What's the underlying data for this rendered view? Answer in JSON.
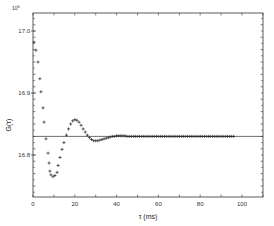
{
  "chart_data": {
    "type": "scatter",
    "title": "",
    "xlabel": "τ (ms)",
    "ylabel": "G(τ)",
    "y_multiplier": "10^6",
    "y_multiplier_label": "10",
    "y_multiplier_exp": "6",
    "xlim": [
      0,
      110
    ],
    "ylim": [
      16.73,
      17.03
    ],
    "x_ticks": [
      0,
      20,
      40,
      60,
      80,
      100
    ],
    "x_tick_labels": [
      "0",
      "20",
      "40",
      "60",
      "80",
      "100"
    ],
    "y_ticks": [
      16.8,
      16.9,
      17.0
    ],
    "y_tick_labels": [
      "16.8",
      "16.9",
      "17.0"
    ],
    "baseline": 16.83,
    "grid": false,
    "marker": "+",
    "series": [
      {
        "name": "G(τ)",
        "x": [
          0.5,
          1.4,
          2.4,
          3.3,
          3.8,
          4.8,
          5.3,
          6.2,
          7.2,
          7.7,
          8.1,
          8.6,
          9.6,
          10.5,
          11.5,
          12.0,
          12.9,
          13.9,
          14.8,
          16,
          17,
          18,
          19,
          20,
          21,
          22,
          23,
          24,
          25,
          26,
          27,
          28,
          29,
          30,
          31,
          32,
          33,
          34,
          35,
          36,
          37,
          38,
          39,
          40,
          41,
          42,
          43,
          44,
          45,
          46,
          47,
          48,
          49,
          50,
          51,
          52,
          53,
          54,
          55,
          56,
          57,
          58,
          59,
          60,
          61,
          62,
          63,
          64,
          65,
          66,
          67,
          68,
          69,
          70,
          71,
          72,
          73,
          74,
          75,
          76,
          77,
          78,
          79,
          80,
          81,
          82,
          83,
          84,
          85,
          86,
          87,
          88,
          89,
          90,
          91,
          92,
          93,
          94,
          95,
          96
        ],
        "y": [
          16.982,
          16.969,
          16.95,
          16.923,
          16.902,
          16.876,
          16.853,
          16.826,
          16.803,
          16.787,
          16.774,
          16.768,
          16.765,
          16.767,
          16.772,
          16.783,
          16.796,
          16.809,
          16.82,
          16.832,
          16.842,
          16.85,
          16.855,
          16.857,
          16.856,
          16.853,
          16.848,
          16.842,
          16.837,
          16.832,
          16.828,
          16.825,
          16.823,
          16.823,
          16.823,
          16.824,
          16.825,
          16.826,
          16.827,
          16.828,
          16.829,
          16.83,
          16.83,
          16.831,
          16.831,
          16.831,
          16.831,
          16.831,
          16.83,
          16.83,
          16.83,
          16.83,
          16.83,
          16.83,
          16.83,
          16.83,
          16.83,
          16.83,
          16.83,
          16.83,
          16.83,
          16.83,
          16.83,
          16.83,
          16.83,
          16.83,
          16.83,
          16.83,
          16.83,
          16.83,
          16.83,
          16.83,
          16.83,
          16.83,
          16.83,
          16.83,
          16.83,
          16.83,
          16.83,
          16.83,
          16.83,
          16.83,
          16.83,
          16.83,
          16.83,
          16.83,
          16.83,
          16.83,
          16.83,
          16.83,
          16.83,
          16.83,
          16.83,
          16.83,
          16.83,
          16.83,
          16.83,
          16.83,
          16.83,
          16.83
        ]
      }
    ]
  },
  "colors": {
    "axis": "#333333",
    "marker": "#222222",
    "baseline": "#333333",
    "background": "#ffffff"
  }
}
